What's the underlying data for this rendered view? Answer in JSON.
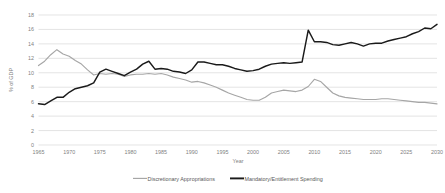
{
  "chart_data": {
    "type": "line",
    "title": "",
    "xlabel": "Year",
    "ylabel": "% of GDP",
    "xlim": [
      1965,
      2030
    ],
    "ylim": [
      0,
      18
    ],
    "grid": true,
    "legend_position": "bottom",
    "xticks": [
      1965,
      1970,
      1975,
      1980,
      1985,
      1990,
      1995,
      2000,
      2005,
      2010,
      2015,
      2020,
      2025,
      2030
    ],
    "yticks": [
      0,
      2,
      4,
      6,
      8,
      10,
      12,
      14,
      16,
      18
    ],
    "x": [
      1965,
      1966,
      1967,
      1968,
      1969,
      1970,
      1971,
      1972,
      1973,
      1974,
      1975,
      1976,
      1977,
      1978,
      1979,
      1980,
      1981,
      1982,
      1983,
      1984,
      1985,
      1986,
      1987,
      1988,
      1989,
      1990,
      1991,
      1992,
      1993,
      1994,
      1995,
      1996,
      1997,
      1998,
      1999,
      2000,
      2001,
      2002,
      2003,
      2004,
      2005,
      2006,
      2007,
      2008,
      2009,
      2010,
      2011,
      2012,
      2013,
      2014,
      2015,
      2016,
      2017,
      2018,
      2019,
      2020,
      2021,
      2022,
      2023,
      2024,
      2025,
      2026,
      2027,
      2028,
      2029,
      2030
    ],
    "series": [
      {
        "name": "Discretionary Appropriations",
        "color": "#a6a6a6",
        "values": [
          11.0,
          11.6,
          12.5,
          13.2,
          12.6,
          12.3,
          11.7,
          11.2,
          10.4,
          9.7,
          9.9,
          9.8,
          9.9,
          9.8,
          9.5,
          9.7,
          9.8,
          9.8,
          9.9,
          9.8,
          9.9,
          9.7,
          9.4,
          9.2,
          9.0,
          8.7,
          8.8,
          8.6,
          8.3,
          8.0,
          7.6,
          7.2,
          6.9,
          6.6,
          6.3,
          6.2,
          6.2,
          6.6,
          7.2,
          7.4,
          7.6,
          7.5,
          7.4,
          7.6,
          8.1,
          9.1,
          8.8,
          8.0,
          7.2,
          6.8,
          6.6,
          6.5,
          6.4,
          6.3,
          6.3,
          6.3,
          6.4,
          6.4,
          6.3,
          6.2,
          6.1,
          6.0,
          5.9,
          5.9,
          5.8,
          5.7
        ]
      },
      {
        "name": "Mandatory/Entitlement Spending",
        "color": "#1a1a1a",
        "values": [
          5.7,
          5.6,
          6.1,
          6.6,
          6.6,
          7.3,
          7.8,
          8.0,
          8.2,
          8.6,
          10.1,
          10.5,
          10.2,
          9.9,
          9.6,
          10.1,
          10.5,
          11.2,
          11.6,
          10.5,
          10.6,
          10.5,
          10.2,
          10.1,
          9.9,
          10.4,
          11.5,
          11.5,
          11.3,
          11.1,
          11.1,
          10.9,
          10.6,
          10.4,
          10.2,
          10.3,
          10.5,
          10.9,
          11.2,
          11.3,
          11.4,
          11.3,
          11.4,
          11.5,
          15.9,
          14.3,
          14.3,
          14.2,
          13.9,
          13.8,
          14.0,
          14.2,
          14.0,
          13.7,
          14.0,
          14.1,
          14.1,
          14.4,
          14.6,
          14.8,
          15.0,
          15.4,
          15.7,
          16.2,
          16.1,
          16.7
        ]
      }
    ]
  },
  "legend": {
    "items": [
      {
        "label": "Discretionary Appropriations"
      },
      {
        "label": "Mandatory/Entitlement Spending"
      }
    ]
  }
}
